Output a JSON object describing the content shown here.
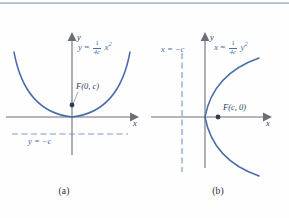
{
  "figure": {
    "panels": [
      {
        "caption": "(a)",
        "equation": {
          "lhs": "y",
          "eq": "=",
          "num": "1",
          "den": "4c",
          "var": "x",
          "exp": "2",
          "full": "y = (1/4c)x^2"
        },
        "focus_label": "F(0, c)",
        "directrix_label": "y = −c",
        "axis_x_label": "x",
        "axis_y_label": "y",
        "curve_color": "#4a6ca8",
        "axis_color": "#6b6f74",
        "directrix_color": "#7e9acb",
        "orientation": "opens-up"
      },
      {
        "caption": "(b)",
        "equation": {
          "lhs": "x",
          "eq": "=",
          "num": "1",
          "den": "4c",
          "var": "y",
          "exp": "2",
          "full": "x = (1/4c)y^2"
        },
        "focus_label": "F(c, 0)",
        "directrix_label": "x = −c",
        "axis_x_label": "x",
        "axis_y_label": "y",
        "curve_color": "#4a6ca8",
        "axis_color": "#6b6f74",
        "directrix_color": "#7e9acb",
        "orientation": "opens-right"
      }
    ]
  }
}
